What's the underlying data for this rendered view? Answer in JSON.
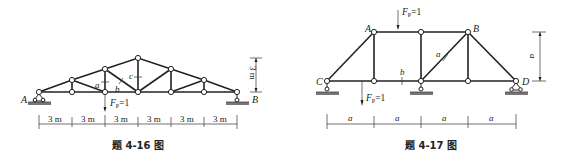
{
  "figure_left": {
    "caption": "题 4-16 图",
    "support_left": "A",
    "support_right": "B",
    "member_labels": [
      "a",
      "b",
      "c"
    ],
    "load": "F",
    "load_sub": "P",
    "load_val": "=1",
    "height_dim": "3 m",
    "span_dims": [
      "3 m",
      "3 m",
      "3 m",
      "3 m",
      "3 m",
      "3 m"
    ]
  },
  "figure_right": {
    "caption": "题 4-17 图",
    "nodes": [
      "A",
      "B",
      "C",
      "D"
    ],
    "member_labels": [
      "a",
      "b"
    ],
    "load_top": {
      "F": "F",
      "sub": "P",
      "val": "=1"
    },
    "load_bottom": {
      "F": "F",
      "sub": "P",
      "val": "=1"
    },
    "height_dim": "a",
    "span_dims": [
      "a",
      "a",
      "a",
      "a"
    ]
  }
}
